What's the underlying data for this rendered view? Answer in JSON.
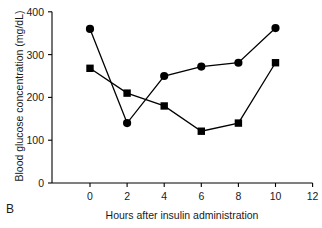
{
  "panel": {
    "label": "B"
  },
  "chart_data": {
    "type": "line",
    "title": "",
    "subtitle": "",
    "xlabel": "Hours after insulin administration",
    "ylabel": "Blood glucose concentration (mg/dL)",
    "xlim": [
      -1.2,
      12
    ],
    "ylim": [
      0,
      400
    ],
    "xticks": [
      0,
      2,
      4,
      6,
      8,
      10,
      12
    ],
    "xtick_labels": [
      "0",
      "2",
      "4",
      "6",
      "8",
      "10",
      "12"
    ],
    "yticks": [
      0,
      100,
      200,
      300,
      400
    ],
    "ytick_labels": [
      "0",
      "100",
      "200",
      "300",
      "400"
    ],
    "grid": false,
    "legend": "none",
    "x": [
      0,
      2,
      4,
      6,
      8,
      10
    ],
    "series": [
      {
        "name": "circle-series",
        "marker": "circle",
        "color": "#000000",
        "values": [
          360,
          140,
          250,
          272,
          281,
          362
        ]
      },
      {
        "name": "square-series",
        "marker": "square",
        "color": "#000000",
        "values": [
          268,
          210,
          180,
          121,
          140,
          281
        ]
      }
    ]
  }
}
